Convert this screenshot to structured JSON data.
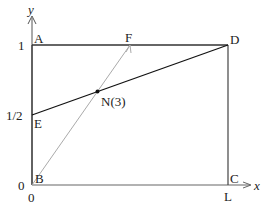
{
  "axes": {
    "x_label": "x",
    "y_label": "y",
    "x_ticks": [
      "0"
    ],
    "y_ticks": [
      "0",
      "1/2",
      "1"
    ]
  },
  "points": {
    "A": "A",
    "B": "B",
    "C": "C",
    "D": "D",
    "E": "E",
    "F": "F",
    "L": "L",
    "N": "N(3)"
  },
  "colors": {
    "frame": "#333333",
    "line_ED": "#111111",
    "line_BF": "#aaaaaa",
    "axis": "#666666"
  }
}
